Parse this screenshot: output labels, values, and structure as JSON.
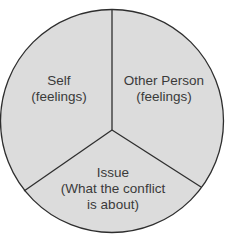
{
  "diagram": {
    "type": "pie-diagram",
    "fill_color": "#dcdcdc",
    "stroke_color": "#2e2e2e",
    "segments": [
      {
        "id": "self",
        "line1": "Self",
        "line2": "(feelings)"
      },
      {
        "id": "other-person",
        "line1": "Other Person",
        "line2": "(feelings)"
      },
      {
        "id": "issue",
        "line1": "Issue",
        "line2": "(What the conflict",
        "line3": "is about)"
      }
    ]
  }
}
